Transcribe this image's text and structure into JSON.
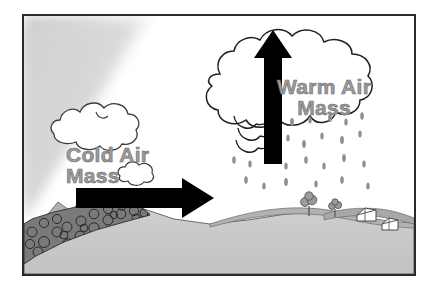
{
  "diagram": {
    "frame": {
      "border_color": "#2a2a2a",
      "background": "#ffffff"
    },
    "labels": {
      "cold_air_mass": "Cold Air\nMass",
      "warm_air_mass": "Warm Air\nMass",
      "text_color": "#9b9b9b",
      "text_outline_color": "#6f6f6f"
    },
    "arrows": {
      "horizontal": {
        "name": "cold-air-advance-arrow",
        "direction": "right",
        "color": "#000000"
      },
      "vertical": {
        "name": "warm-air-rising-arrow",
        "direction": "up",
        "color": "#000000"
      }
    },
    "clouds": {
      "cold_cloud": {
        "name": "cold-air-cloud",
        "fill": "#ffffff",
        "outline": "#3b3b3b"
      },
      "storm_cloud": {
        "name": "cumulonimbus-storm-cloud",
        "fill": "#ffffff",
        "outline": "#1e1e1e"
      }
    },
    "precipitation": {
      "name": "rain-drops",
      "color": "#8f8f8f",
      "count": 26
    },
    "air_mass_wedge": {
      "name": "cold-air-mass-wedge",
      "fill": "#d2d2d2",
      "note": "soft gray gradient wedge sloping down to the right"
    },
    "terrain": {
      "ground_fill": "#c9c9c9",
      "hill_fill": "#b0b0b0",
      "rock_band_fill": "#6e6e6e",
      "rock_outline": "#2e2e2e",
      "outline": "#4a4a4a"
    },
    "scenery": {
      "trees": 2,
      "houses": 2,
      "tree_fill": "#9a9a9a",
      "house_fill": "#ffffff",
      "house_outline": "#4a4a4a"
    }
  }
}
